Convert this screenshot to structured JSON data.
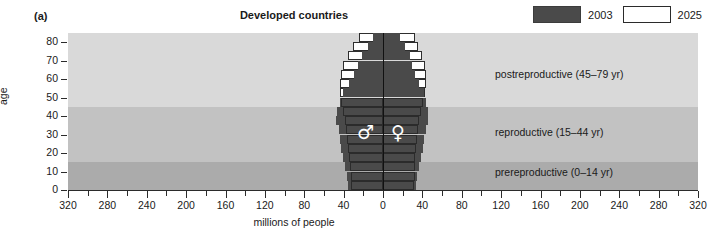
{
  "panel": {
    "label": "(a)"
  },
  "legend": {
    "items": [
      {
        "label": "2003",
        "color": "#4a4a4a",
        "style": "filled"
      },
      {
        "label": "2025",
        "color": "#ffffff",
        "style": "outline"
      }
    ]
  },
  "bands": [
    {
      "name": "postreproductive",
      "label": "postreproductive (45–79 yr)",
      "age_min": 45,
      "age_max": 85,
      "color": "#d9d9d9"
    },
    {
      "name": "reproductive",
      "label": "reproductive (15–44 yr)",
      "age_min": 15,
      "age_max": 45,
      "color": "#c2c2c2"
    },
    {
      "name": "prereproductive",
      "label": "prereproductive (0–14 yr)",
      "age_min": 0,
      "age_max": 15,
      "color": "#ababab"
    }
  ],
  "symbols": {
    "male": "♂",
    "female": "♀"
  },
  "chart_data": {
    "type": "bar",
    "subtype": "population-pyramid",
    "title": "Developed countries",
    "xlabel": "millions of people",
    "ylabel": "age",
    "xlim": [
      -320,
      320
    ],
    "ylim": [
      0,
      85
    ],
    "x_tick_labels": [
      "320",
      "280",
      "240",
      "200",
      "160",
      "120",
      "80",
      "40",
      "0",
      "40",
      "80",
      "120",
      "160",
      "200",
      "240",
      "280",
      "320"
    ],
    "x_tick_values": [
      -320,
      -280,
      -240,
      -200,
      -160,
      -120,
      -80,
      -40,
      0,
      40,
      80,
      120,
      160,
      200,
      240,
      280,
      320
    ],
    "x_minor_step": 20,
    "y_tick_labels": [
      "0",
      "10",
      "20",
      "30",
      "40",
      "50",
      "60",
      "70",
      "80"
    ],
    "y_tick_values": [
      0,
      10,
      20,
      30,
      40,
      50,
      60,
      70,
      80
    ],
    "grid": false,
    "legend_position": "top-right",
    "age_groups": [
      "0-4",
      "5-9",
      "10-14",
      "15-19",
      "20-24",
      "25-29",
      "30-34",
      "35-39",
      "40-44",
      "45-49",
      "50-54",
      "55-59",
      "60-64",
      "65-69",
      "70-74",
      "75-79",
      "80+"
    ],
    "series": [
      {
        "name": "2003",
        "male": [
          36,
          37,
          39,
          41,
          43,
          44,
          45,
          48,
          47,
          44,
          41,
          35,
          29,
          25,
          21,
          15,
          10
        ],
        "female": [
          34,
          35,
          37,
          39,
          41,
          42,
          44,
          46,
          46,
          44,
          42,
          37,
          32,
          29,
          27,
          22,
          17
        ]
      },
      {
        "name": "2025",
        "male": [
          33,
          33,
          34,
          35,
          36,
          37,
          38,
          39,
          41,
          43,
          44,
          44,
          43,
          41,
          36,
          30,
          24
        ],
        "female": [
          31,
          32,
          32,
          33,
          34,
          35,
          36,
          37,
          39,
          41,
          43,
          44,
          44,
          43,
          40,
          36,
          32
        ]
      }
    ]
  }
}
